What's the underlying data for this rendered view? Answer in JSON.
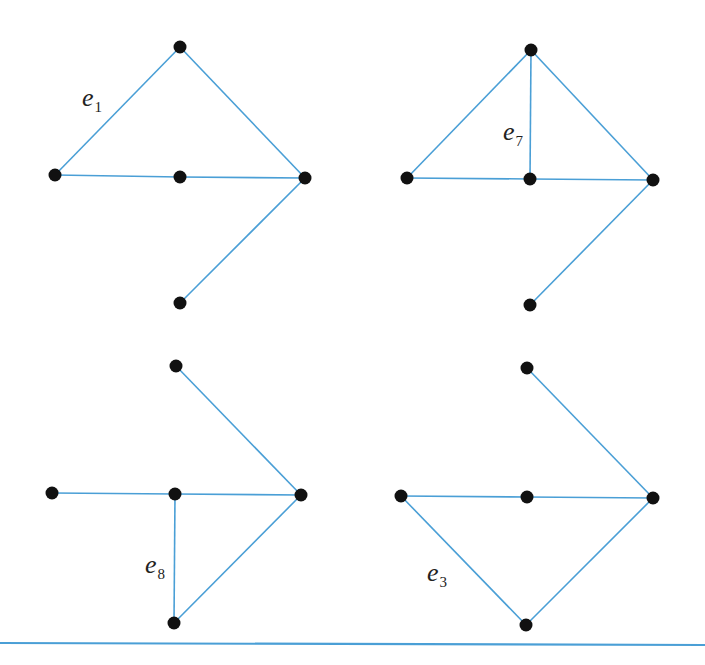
{
  "figure": {
    "colors": {
      "edge": "#4a9fd6",
      "node": "#111111",
      "rule": "#4a9fd6"
    },
    "graphs": [
      {
        "id": "top-left",
        "label": {
          "base": "e",
          "sub": "1",
          "x": 82,
          "y": 106
        },
        "nodes": [
          [
            180,
            47
          ],
          [
            55,
            175
          ],
          [
            180,
            177
          ],
          [
            305,
            178
          ],
          [
            180,
            303
          ]
        ],
        "edges": [
          [
            0,
            1
          ],
          [
            0,
            3
          ],
          [
            1,
            2
          ],
          [
            2,
            3
          ],
          [
            3,
            4
          ]
        ]
      },
      {
        "id": "top-right",
        "label": {
          "base": "e",
          "sub": "7",
          "x": 503,
          "y": 140
        },
        "nodes": [
          [
            531,
            50
          ],
          [
            407,
            178
          ],
          [
            530,
            179
          ],
          [
            653,
            180
          ],
          [
            530,
            305
          ]
        ],
        "edges": [
          [
            0,
            1
          ],
          [
            0,
            2
          ],
          [
            0,
            3
          ],
          [
            1,
            2
          ],
          [
            2,
            3
          ],
          [
            3,
            4
          ]
        ]
      },
      {
        "id": "bottom-left",
        "label": {
          "base": "e",
          "sub": "8",
          "x": 145,
          "y": 573
        },
        "nodes": [
          [
            176,
            366
          ],
          [
            52,
            493
          ],
          [
            175,
            494
          ],
          [
            301,
            495
          ],
          [
            174,
            623
          ]
        ],
        "edges": [
          [
            0,
            3
          ],
          [
            1,
            2
          ],
          [
            2,
            3
          ],
          [
            2,
            4
          ],
          [
            4,
            3
          ]
        ]
      },
      {
        "id": "bottom-right",
        "label": {
          "base": "e",
          "sub": "3",
          "x": 427,
          "y": 581
        },
        "nodes": [
          [
            527,
            368
          ],
          [
            401,
            496
          ],
          [
            527,
            497
          ],
          [
            653,
            498
          ],
          [
            526,
            625
          ]
        ],
        "edges": [
          [
            0,
            3
          ],
          [
            1,
            2
          ],
          [
            2,
            3
          ],
          [
            1,
            4
          ],
          [
            4,
            3
          ]
        ]
      }
    ],
    "rule": {
      "x1": 0,
      "y1": 643,
      "x2": 705,
      "y2": 645
    }
  }
}
